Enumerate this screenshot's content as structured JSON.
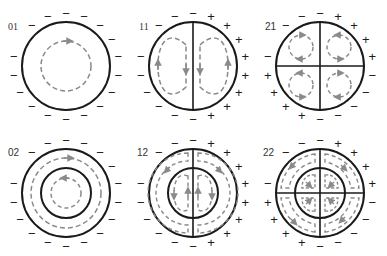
{
  "diagram": {
    "colors": {
      "outline": "#1a1a1a",
      "field_lines": "#8a8a8a",
      "background": "#ffffff"
    },
    "panels": [
      {
        "id": "01",
        "label": "01",
        "row": 0,
        "col": 0,
        "center": [
          66,
          66
        ],
        "outer_radius": 44,
        "inner_radius": null,
        "dividers": [],
        "charge_signs": "all-negative",
        "field_loops": "single circular loop, arrow pointing right at top"
      },
      {
        "id": "11",
        "label": "11",
        "row": 0,
        "col": 1,
        "center": [
          193,
          66
        ],
        "outer_radius": 44,
        "inner_radius": null,
        "dividers": [
          "vertical"
        ],
        "charge_signs": "left-negative / right-positive",
        "field_loops": "two vertical oval loops; left: up on outer side, down on inner side; right: down on inner side, up on outer side"
      },
      {
        "id": "21",
        "label": "21",
        "row": 0,
        "col": 2,
        "center": [
          320,
          66
        ],
        "outer_radius": 44,
        "inner_radius": null,
        "dividers": [
          "vertical",
          "horizontal"
        ],
        "charge_signs": "quadrant alternating: top-left negative, top-right positive, bottom-right negative, bottom-left positive",
        "field_loops": "four small circular loops, one per quadrant"
      },
      {
        "id": "02",
        "label": "02",
        "row": 1,
        "col": 0,
        "center": [
          66,
          193
        ],
        "outer_radius": 44,
        "inner_radius": 25,
        "dividers": [],
        "charge_signs": "all-negative",
        "field_loops": "outer ring loop arrow right at top; inner loop arrow left at top"
      },
      {
        "id": "12",
        "label": "12",
        "row": 1,
        "col": 1,
        "center": [
          193,
          193
        ],
        "outer_radius": 44,
        "inner_radius": 25,
        "dividers": [
          "vertical"
        ],
        "charge_signs": "left-negative / right-positive",
        "field_loops": "two half-ring loops in outer annulus, two vertical loops in inner disk"
      },
      {
        "id": "22",
        "label": "22",
        "row": 1,
        "col": 2,
        "center": [
          320,
          193
        ],
        "outer_radius": 44,
        "inner_radius": 25,
        "dividers": [
          "vertical",
          "horizontal"
        ],
        "charge_signs": "quadrant alternating: top-left negative, top-right positive, bottom-right negative, bottom-left positive",
        "field_loops": "four quarter-ring loops in outer annulus, four small loops in inner disk"
      }
    ],
    "sign_symbols": {
      "negative": "−",
      "positive": "+"
    }
  }
}
